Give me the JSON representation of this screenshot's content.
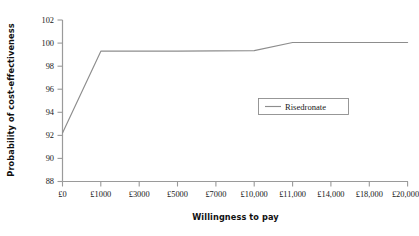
{
  "chart_data": {
    "type": "line",
    "title": "",
    "xlabel": "Willingness to pay",
    "ylabel": "Probability of cost-effectiveness",
    "categories": [
      "£0",
      "£1000",
      "£3000",
      "£5000",
      "£7000",
      "£10,000",
      "£11,000",
      "£14,000",
      "£18,000",
      "£20,000"
    ],
    "ytick_labels": [
      "88",
      "90",
      "92",
      "94",
      "96",
      "98",
      "100",
      "102"
    ],
    "yticks": [
      88,
      90,
      92,
      94,
      96,
      98,
      100,
      102
    ],
    "ylim": [
      88,
      102
    ],
    "grid": false,
    "legend_position": "inside-right",
    "series": [
      {
        "name": "Risedronate",
        "color": "#8d8d8d",
        "values": [
          92.2,
          99.3,
          99.3,
          99.3,
          99.32,
          99.35,
          100.05,
          100.05,
          100.05,
          100.05
        ]
      }
    ]
  },
  "axes": {
    "x_title": "Willingness to pay",
    "y_title": "Probability of cost-effectiveness"
  },
  "legend": {
    "entries": [
      {
        "label": "Risedronate",
        "swatch": "line-swatch"
      }
    ]
  },
  "colors": {
    "series_line": "#8d8d8d",
    "axis": "#9a9a9a",
    "text": "#1a1a1a",
    "background": "#ffffff",
    "legend_border": "#8d8d8d"
  }
}
